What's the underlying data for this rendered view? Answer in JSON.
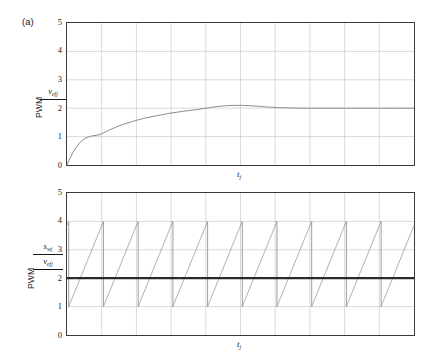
{
  "figure": {
    "panel_tag": "(a)"
  },
  "panels": [
    {
      "id": "a",
      "tag": "(a)",
      "ylabel": {
        "pwm": "PWM",
        "numerator": "v",
        "numerator_sub": "ef",
        "numerator_sub2": "j"
      },
      "xlabel": {
        "base": "t",
        "sub": "j"
      },
      "yticks": [
        "5",
        "4",
        "3",
        "2",
        "1",
        "0"
      ]
    },
    {
      "id": "b",
      "ylabel": {
        "pwm": "PWM",
        "numerator": "s",
        "numerator_sub": "w",
        "numerator_sub2": "j",
        "denominator": "v",
        "denominator_sub": "ef",
        "denominator_sub2": "j"
      },
      "xlabel": {
        "base": "t",
        "sub": "j"
      },
      "yticks": [
        "5",
        "4",
        "3",
        "2",
        "1",
        "0"
      ]
    }
  ],
  "chart_data": [
    {
      "type": "line",
      "id": "step-response",
      "title": "(a)",
      "xlabel": "t_j",
      "ylabel": "v_efj / PWM",
      "ylim": [
        0,
        5
      ],
      "xlim": [
        0,
        10
      ],
      "yticks": [
        0,
        1,
        2,
        3,
        4,
        5
      ],
      "grid": true,
      "grid_columns": 10,
      "legend": "none",
      "line_color": "#8c8c8c",
      "series": [
        {
          "name": "v_efj",
          "x": [
            0.0,
            0.08,
            0.16,
            0.26,
            0.38,
            0.52,
            0.7,
            0.92,
            1.0,
            1.2,
            1.5,
            1.85,
            2.2,
            2.6,
            3.0,
            3.4,
            3.8,
            4.1,
            4.35,
            4.6,
            4.85,
            5.05,
            5.25,
            5.5,
            5.8,
            6.1,
            6.4,
            6.8,
            7.2,
            7.6,
            8.0,
            8.5,
            9.0,
            9.5,
            10.0
          ],
          "y": [
            0.0,
            0.22,
            0.42,
            0.62,
            0.8,
            0.94,
            1.02,
            1.06,
            1.1,
            1.22,
            1.38,
            1.52,
            1.64,
            1.74,
            1.83,
            1.9,
            1.96,
            2.02,
            2.06,
            2.09,
            2.1,
            2.1,
            2.09,
            2.07,
            2.04,
            2.02,
            2.01,
            2.0,
            2.0,
            2.0,
            2.0,
            2.0,
            2.0,
            2.0,
            2.0
          ]
        }
      ]
    },
    {
      "type": "line",
      "id": "pwm-carrier-comparison",
      "xlabel": "t_j",
      "ylabel": "s_wj / v_efj",
      "ylim": [
        0,
        5
      ],
      "xlim": [
        0,
        10
      ],
      "yticks": [
        0,
        1,
        2,
        3,
        4,
        5
      ],
      "grid": true,
      "grid_columns": 10,
      "legend": "none",
      "series": [
        {
          "name": "s_wj carrier",
          "type": "sawtooth",
          "color": "#8c8c8c",
          "ramp_min": 1.0,
          "ramp_max": 4.0,
          "period": 1.0,
          "phase": 0.95,
          "cycles": 10
        },
        {
          "name": "v_efj reference",
          "type": "constant",
          "color": "#2a2a2a",
          "value": 2.0,
          "linewidth": 2.2
        }
      ]
    }
  ]
}
